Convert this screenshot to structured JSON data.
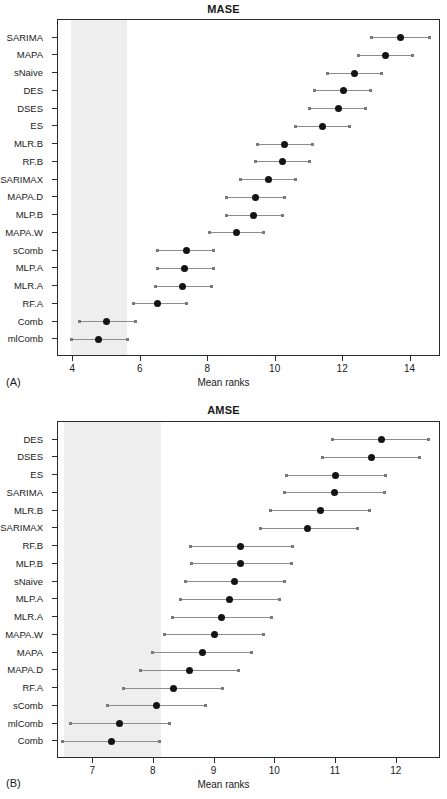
{
  "panels": [
    {
      "tag": "(A)",
      "title": "MASE",
      "xlabel": "Mean ranks"
    },
    {
      "tag": "(B)",
      "title": "AMSE",
      "xlabel": "Mean ranks"
    }
  ],
  "chart_data": [
    {
      "type": "scatter",
      "title": "MASE",
      "xlabel": "Mean ranks",
      "ylabel": "",
      "panel": "(A)",
      "xlim": [
        3.55,
        14.9
      ],
      "xticks": [
        4,
        6,
        8,
        10,
        12,
        14
      ],
      "xticklabels": [
        "4",
        "6",
        "8",
        "10",
        "12",
        "14"
      ],
      "grid": false,
      "legend": null,
      "annotation": "Grey vertical band marks the critical-difference region of the best-performing method",
      "shaded_band": [
        3.95,
        5.6
      ],
      "categories": [
        "SARIMA",
        "MAPA",
        "sNaive",
        "DES",
        "DSES",
        "ES",
        "MLR.B",
        "RF.B",
        "SARIMAX",
        "MAPA.D",
        "MLP.B",
        "MAPA.W",
        "sComb",
        "MLP.A",
        "MLR.A",
        "RF.A",
        "Comb",
        "mlComb"
      ],
      "points": [
        {
          "label": "SARIMA",
          "mean": 13.7,
          "lower": 12.85,
          "upper": 14.55
        },
        {
          "label": "MAPA",
          "mean": 13.25,
          "lower": 12.45,
          "upper": 14.05
        },
        {
          "label": "sNaive",
          "mean": 12.35,
          "lower": 11.55,
          "upper": 13.15
        },
        {
          "label": "DES",
          "mean": 12.0,
          "lower": 11.15,
          "upper": 12.8
        },
        {
          "label": "DSES",
          "mean": 11.85,
          "lower": 11.0,
          "upper": 12.65
        },
        {
          "label": "ES",
          "mean": 11.4,
          "lower": 10.6,
          "upper": 12.2
        },
        {
          "label": "MLR.B",
          "mean": 10.25,
          "lower": 9.45,
          "upper": 11.1
        },
        {
          "label": "RF.B",
          "mean": 10.2,
          "lower": 9.4,
          "upper": 11.0
        },
        {
          "label": "SARIMAX",
          "mean": 9.8,
          "lower": 8.95,
          "upper": 10.6
        },
        {
          "label": "MAPA.D",
          "mean": 9.4,
          "lower": 8.55,
          "upper": 10.25
        },
        {
          "label": "MLP.B",
          "mean": 9.35,
          "lower": 8.55,
          "upper": 10.2
        },
        {
          "label": "MAPA.W",
          "mean": 8.85,
          "lower": 8.05,
          "upper": 9.65
        },
        {
          "label": "sComb",
          "mean": 7.35,
          "lower": 6.5,
          "upper": 8.15
        },
        {
          "label": "MLP.A",
          "mean": 7.3,
          "lower": 6.5,
          "upper": 8.15
        },
        {
          "label": "MLR.A",
          "mean": 7.25,
          "lower": 6.45,
          "upper": 8.1
        },
        {
          "label": "RF.A",
          "mean": 6.5,
          "lower": 5.8,
          "upper": 7.35
        },
        {
          "label": "Comb",
          "mean": 5.0,
          "lower": 4.2,
          "upper": 5.85
        },
        {
          "label": "mlComb",
          "mean": 4.75,
          "lower": 3.95,
          "upper": 5.6
        }
      ]
    },
    {
      "type": "scatter",
      "title": "AMSE",
      "xlabel": "Mean ranks",
      "ylabel": "",
      "panel": "(B)",
      "xlim": [
        6.42,
        12.73
      ],
      "xticks": [
        7,
        8,
        9,
        10,
        11,
        12
      ],
      "xticklabels": [
        "7",
        "8",
        "9",
        "10",
        "11",
        "12"
      ],
      "grid": false,
      "legend": null,
      "annotation": "Grey vertical band marks the critical-difference region of the best-performing method",
      "shaded_band": [
        6.52,
        8.12
      ],
      "categories": [
        "DES",
        "DSES",
        "ES",
        "SARIMA",
        "MLR.B",
        "SARIMAX",
        "RF.B",
        "MLP.B",
        "sNaive",
        "MLP.A",
        "MLR.A",
        "MAPA.W",
        "MAPA",
        "MAPA.D",
        "RF.A",
        "sComb",
        "mlComb",
        "Comb"
      ],
      "points": [
        {
          "label": "DES",
          "mean": 11.75,
          "lower": 10.95,
          "upper": 12.52
        },
        {
          "label": "DSES",
          "mean": 11.58,
          "lower": 10.78,
          "upper": 12.38
        },
        {
          "label": "ES",
          "mean": 11.0,
          "lower": 10.18,
          "upper": 11.82
        },
        {
          "label": "SARIMA",
          "mean": 10.98,
          "lower": 10.15,
          "upper": 11.8
        },
        {
          "label": "MLR.B",
          "mean": 10.75,
          "lower": 9.92,
          "upper": 11.55
        },
        {
          "label": "SARIMAX",
          "mean": 10.53,
          "lower": 9.75,
          "upper": 11.35
        },
        {
          "label": "RF.B",
          "mean": 9.43,
          "lower": 8.6,
          "upper": 10.28
        },
        {
          "label": "MLP.B",
          "mean": 9.42,
          "lower": 8.62,
          "upper": 10.27
        },
        {
          "label": "sNaive",
          "mean": 9.33,
          "lower": 8.52,
          "upper": 10.15
        },
        {
          "label": "MLP.A",
          "mean": 9.25,
          "lower": 8.43,
          "upper": 10.07
        },
        {
          "label": "MLR.A",
          "mean": 9.12,
          "lower": 8.3,
          "upper": 9.93
        },
        {
          "label": "MAPA.W",
          "mean": 9.0,
          "lower": 8.18,
          "upper": 9.8
        },
        {
          "label": "MAPA",
          "mean": 8.8,
          "lower": 7.98,
          "upper": 9.6
        },
        {
          "label": "MAPA.D",
          "mean": 8.58,
          "lower": 7.78,
          "upper": 9.4
        },
        {
          "label": "RF.A",
          "mean": 8.32,
          "lower": 7.5,
          "upper": 9.13
        },
        {
          "label": "sComb",
          "mean": 8.05,
          "lower": 7.23,
          "upper": 8.85
        },
        {
          "label": "mlComb",
          "mean": 7.43,
          "lower": 6.62,
          "upper": 8.25
        },
        {
          "label": "Comb",
          "mean": 7.3,
          "lower": 6.5,
          "upper": 8.1
        }
      ]
    }
  ]
}
